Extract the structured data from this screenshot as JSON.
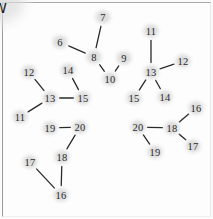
{
  "diagram": {
    "background_color": "#fdfdfd",
    "border_color": "#9a9a9a",
    "node_halo_color": "#d1d1d1",
    "edge_color": "#2a2a2a",
    "center": {
      "number": "5",
      "letter": "W",
      "x": 110,
      "y": 120
    },
    "nodes": [
      {
        "id": "n-top-6",
        "label": "6",
        "x": 60,
        "y": 42
      },
      {
        "id": "n-top-7",
        "label": "7",
        "x": 103,
        "y": 17
      },
      {
        "id": "n-top-8",
        "label": "8",
        "x": 94,
        "y": 57
      },
      {
        "id": "n-top-9",
        "label": "9",
        "x": 124,
        "y": 58
      },
      {
        "id": "n-top-10",
        "label": "10",
        "x": 110,
        "y": 79
      },
      {
        "id": "n-ne-11",
        "label": "11",
        "x": 151,
        "y": 31
      },
      {
        "id": "n-ne-12",
        "label": "12",
        "x": 183,
        "y": 61
      },
      {
        "id": "n-ne-13",
        "label": "13",
        "x": 151,
        "y": 72
      },
      {
        "id": "n-ne-15",
        "label": "15",
        "x": 134,
        "y": 98
      },
      {
        "id": "n-ne-14",
        "label": "14",
        "x": 165,
        "y": 97
      },
      {
        "id": "n-w-12",
        "label": "12",
        "x": 29,
        "y": 72
      },
      {
        "id": "n-w-14",
        "label": "14",
        "x": 68,
        "y": 70
      },
      {
        "id": "n-w-13",
        "label": "13",
        "x": 50,
        "y": 98
      },
      {
        "id": "n-w-15",
        "label": "15",
        "x": 83,
        "y": 98
      },
      {
        "id": "n-w-11",
        "label": "11",
        "x": 20,
        "y": 117
      },
      {
        "id": "n-sw-19",
        "label": "19",
        "x": 50,
        "y": 128
      },
      {
        "id": "n-sw-20",
        "label": "20",
        "x": 80,
        "y": 127
      },
      {
        "id": "n-sw-18",
        "label": "18",
        "x": 62,
        "y": 157
      },
      {
        "id": "n-sw-17",
        "label": "17",
        "x": 30,
        "y": 162
      },
      {
        "id": "n-sw-16",
        "label": "16",
        "x": 61,
        "y": 195
      },
      {
        "id": "n-se-20",
        "label": "20",
        "x": 138,
        "y": 127
      },
      {
        "id": "n-se-18",
        "label": "18",
        "x": 172,
        "y": 128
      },
      {
        "id": "n-se-19",
        "label": "19",
        "x": 155,
        "y": 152
      },
      {
        "id": "n-se-16",
        "label": "16",
        "x": 196,
        "y": 108
      },
      {
        "id": "n-se-17",
        "label": "17",
        "x": 193,
        "y": 146
      }
    ],
    "edges": [
      {
        "id": "e-6-8",
        "from": "n-top-6",
        "to": "n-top-8"
      },
      {
        "id": "e-7-8",
        "from": "n-top-7",
        "to": "n-top-8"
      },
      {
        "id": "e-8-10",
        "from": "n-top-8",
        "to": "n-top-10"
      },
      {
        "id": "e-9-10",
        "from": "n-top-9",
        "to": "n-top-10"
      },
      {
        "id": "e-11-13ne",
        "from": "n-ne-11",
        "to": "n-ne-13"
      },
      {
        "id": "e-12-13ne",
        "from": "n-ne-12",
        "to": "n-ne-13"
      },
      {
        "id": "e-13-15ne",
        "from": "n-ne-13",
        "to": "n-ne-15"
      },
      {
        "id": "e-13-14ne",
        "from": "n-ne-13",
        "to": "n-ne-14"
      },
      {
        "id": "e-12-13w",
        "from": "n-w-12",
        "to": "n-w-13"
      },
      {
        "id": "e-11-13w",
        "from": "n-w-11",
        "to": "n-w-13"
      },
      {
        "id": "e-13-15w",
        "from": "n-w-13",
        "to": "n-w-15"
      },
      {
        "id": "e-14-15w",
        "from": "n-w-14",
        "to": "n-w-15"
      },
      {
        "id": "e-19-20sw",
        "from": "n-sw-19",
        "to": "n-sw-20"
      },
      {
        "id": "e-20-18sw",
        "from": "n-sw-20",
        "to": "n-sw-18"
      },
      {
        "id": "e-18-16sw",
        "from": "n-sw-18",
        "to": "n-sw-16"
      },
      {
        "id": "e-17-16sw",
        "from": "n-sw-17",
        "to": "n-sw-16"
      },
      {
        "id": "e-20-18se",
        "from": "n-se-20",
        "to": "n-se-18"
      },
      {
        "id": "e-20-19se",
        "from": "n-se-20",
        "to": "n-se-19"
      },
      {
        "id": "e-18-16se",
        "from": "n-se-18",
        "to": "n-se-16"
      },
      {
        "id": "e-18-17se",
        "from": "n-se-18",
        "to": "n-se-17"
      }
    ]
  }
}
